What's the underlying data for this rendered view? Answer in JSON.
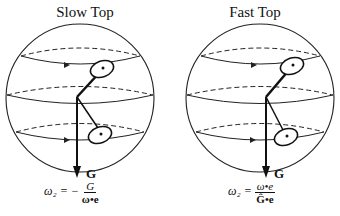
{
  "panels": [
    {
      "title": "Slow Top",
      "vector_label": "G",
      "formula": {
        "lhs": "ω₂ =",
        "sign": "−",
        "numerator": "G",
        "denominator": "ω•e"
      }
    },
    {
      "title": "Fast Top",
      "vector_label": "G",
      "formula": {
        "lhs": "ω₂ =",
        "sign": "",
        "numerator": "ω•e",
        "denominator": "Ĝ•e"
      }
    }
  ]
}
